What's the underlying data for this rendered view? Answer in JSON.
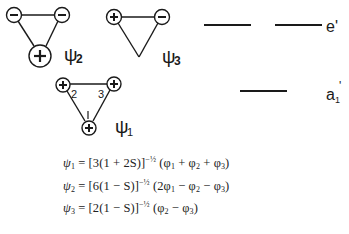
{
  "figure": {
    "mo_diagrams": [
      {
        "id": "psi2",
        "label": "ψ",
        "subscript": "2",
        "nodes": [
          {
            "sign": "−",
            "size": "small"
          },
          {
            "sign": "−",
            "size": "small"
          },
          {
            "sign": "+",
            "size": "large"
          }
        ]
      },
      {
        "id": "psi3",
        "label": "ψ",
        "subscript": "3",
        "nodes": [
          {
            "sign": "+",
            "size": "small"
          },
          {
            "sign": "−",
            "size": "small"
          },
          {
            "sign": "",
            "size": "node"
          }
        ]
      },
      {
        "id": "psi1",
        "label": "ψ",
        "subscript": "1",
        "nodes": [
          {
            "sign": "+",
            "index": "2"
          },
          {
            "sign": "+",
            "index": "3"
          },
          {
            "sign": "+",
            "index": "1"
          }
        ]
      }
    ],
    "energy_levels": [
      {
        "symmetry": "e'",
        "degeneracy": 2
      },
      {
        "symmetry": "a",
        "subscript": "1",
        "prime": "'",
        "degeneracy": 1
      }
    ],
    "equations": [
      {
        "lhs": "ψ",
        "lhs_sub": "1",
        "coef": "[3(1 + 2S)]",
        "exp": "−½",
        "rhs": [
          "(φ",
          "1",
          " + φ",
          "2",
          " + φ",
          "3",
          ")"
        ]
      },
      {
        "lhs": "ψ",
        "lhs_sub": "2",
        "coef": "[6(1 − S)]",
        "exp": "−½",
        "rhs": [
          "(2φ",
          "1",
          " − φ",
          "2",
          " − φ",
          "3",
          ")"
        ]
      },
      {
        "lhs": "ψ",
        "lhs_sub": "3",
        "coef": "[2(1 − S)]",
        "exp": "−½",
        "rhs": [
          "(φ",
          "2",
          " − φ",
          "3",
          ")"
        ]
      }
    ]
  }
}
